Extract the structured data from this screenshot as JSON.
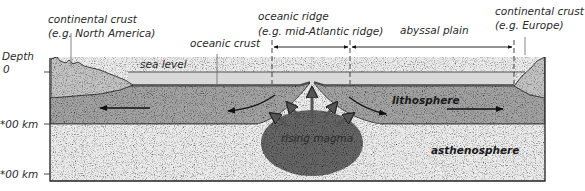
{
  "diagram": {
    "colors": {
      "water": "#d9d9d9",
      "lithosphere": "#a3a3a3",
      "asthenosphere": "#ececec",
      "continental_crust": "#c4c4c4",
      "magma": "#666666",
      "outline": "#333333"
    },
    "depth_axis": {
      "title": "Depth",
      "ticks": [
        {
          "label": "0",
          "y": 72
        },
        {
          "label": "*00 km",
          "y": 124
        },
        {
          "label": "*00 km",
          "y": 174
        }
      ]
    },
    "labels": {
      "continental_crust_left": "continental crust",
      "continental_crust_left_example": "(e.g. North America)",
      "oceanic_crust": "oceanic crust",
      "oceanic_ridge": "oceanic ridge",
      "oceanic_ridge_example": "(e.g. mid-Atlantic ridge)",
      "abyssal_plain": "abyssal plain",
      "continental_crust_right": "continental crust",
      "continental_crust_right_example": "(e.g. Europe)",
      "sea_level": "sea level",
      "lithosphere": "lithosphere",
      "rising_magma": "rising magma",
      "asthenosphere": "asthenosphere"
    },
    "arrows": {
      "lithosphere_motion": [
        "left (away from ridge)",
        "right (away from ridge)"
      ],
      "magma_motion": "upward and outward"
    }
  }
}
